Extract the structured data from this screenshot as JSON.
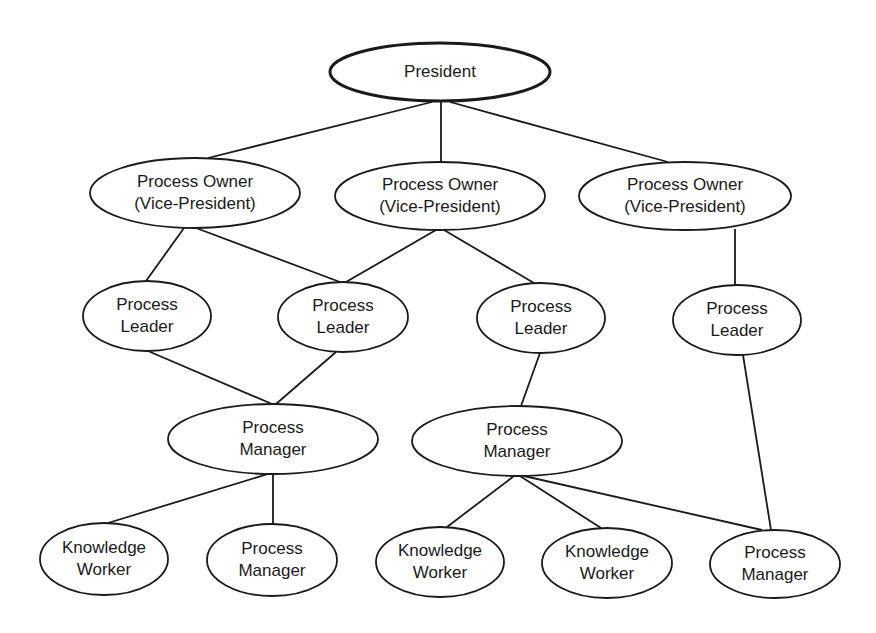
{
  "diagram": {
    "type": "org-chart",
    "colors": {
      "line": "#1a1a1a",
      "background": "#ffffff",
      "node_fill": "#ffffff"
    },
    "nodes": [
      {
        "id": "president",
        "lines": [
          "President"
        ],
        "cx": 440,
        "cy": 72,
        "rx": 110,
        "ry": 29,
        "root": true
      },
      {
        "id": "po1",
        "lines": [
          "Process Owner",
          "(Vice-President)"
        ],
        "cx": 195,
        "cy": 193,
        "rx": 105,
        "ry": 35
      },
      {
        "id": "po2",
        "lines": [
          "Process Owner",
          "(Vice-President)"
        ],
        "cx": 440,
        "cy": 196,
        "rx": 105,
        "ry": 34
      },
      {
        "id": "po3",
        "lines": [
          "Process Owner",
          "(Vice-President)"
        ],
        "cx": 685,
        "cy": 196,
        "rx": 106,
        "ry": 34
      },
      {
        "id": "pl1",
        "lines": [
          "Process",
          "Leader"
        ],
        "cx": 147,
        "cy": 316,
        "rx": 64,
        "ry": 35
      },
      {
        "id": "pl2",
        "lines": [
          "Process",
          "Leader"
        ],
        "cx": 343,
        "cy": 317,
        "rx": 65,
        "ry": 35
      },
      {
        "id": "pl3",
        "lines": [
          "Process",
          "Leader"
        ],
        "cx": 541,
        "cy": 318,
        "rx": 64,
        "ry": 35
      },
      {
        "id": "pl4",
        "lines": [
          "Process",
          "Leader"
        ],
        "cx": 737,
        "cy": 320,
        "rx": 64,
        "ry": 35
      },
      {
        "id": "pm1",
        "lines": [
          "Process",
          "Manager"
        ],
        "cx": 273,
        "cy": 439,
        "rx": 105,
        "ry": 35
      },
      {
        "id": "pm2",
        "lines": [
          "Process",
          "Manager"
        ],
        "cx": 517,
        "cy": 441,
        "rx": 105,
        "ry": 35
      },
      {
        "id": "kw1",
        "lines": [
          "Knowledge",
          "Worker"
        ],
        "cx": 104,
        "cy": 559,
        "rx": 64,
        "ry": 36
      },
      {
        "id": "pm3",
        "lines": [
          "Process",
          "Manager"
        ],
        "cx": 272,
        "cy": 560,
        "rx": 65,
        "ry": 36
      },
      {
        "id": "kw2",
        "lines": [
          "Knowledge",
          "Worker"
        ],
        "cx": 440,
        "cy": 562,
        "rx": 64,
        "ry": 35
      },
      {
        "id": "kw3",
        "lines": [
          "Knowledge",
          "Worker"
        ],
        "cx": 607,
        "cy": 563,
        "rx": 65,
        "ry": 35
      },
      {
        "id": "pm4",
        "lines": [
          "Process",
          "Manager"
        ],
        "cx": 775,
        "cy": 564,
        "rx": 65,
        "ry": 34
      }
    ],
    "edges": [
      {
        "from": "president",
        "to": "po1",
        "x1": 432,
        "y1": 102,
        "x2": 208,
        "y2": 158
      },
      {
        "from": "president",
        "to": "po2",
        "x1": 441,
        "y1": 102,
        "x2": 441,
        "y2": 162
      },
      {
        "from": "president",
        "to": "po3",
        "x1": 450,
        "y1": 102,
        "x2": 668,
        "y2": 162
      },
      {
        "from": "po1",
        "to": "pl1",
        "x1": 184,
        "y1": 228,
        "x2": 146,
        "y2": 281
      },
      {
        "from": "po1",
        "to": "pl2",
        "x1": 196,
        "y1": 228,
        "x2": 340,
        "y2": 282
      },
      {
        "from": "po2",
        "to": "pl2",
        "x1": 436,
        "y1": 230,
        "x2": 346,
        "y2": 282
      },
      {
        "from": "po2",
        "to": "pl3",
        "x1": 444,
        "y1": 230,
        "x2": 534,
        "y2": 283
      },
      {
        "from": "po3",
        "to": "pl4",
        "x1": 735,
        "y1": 229,
        "x2": 735,
        "y2": 285
      },
      {
        "from": "pl1",
        "to": "pm1",
        "x1": 148,
        "y1": 351,
        "x2": 272,
        "y2": 404
      },
      {
        "from": "pl2",
        "to": "pm1",
        "x1": 336,
        "y1": 352,
        "x2": 276,
        "y2": 404
      },
      {
        "from": "pl3",
        "to": "pm2",
        "x1": 540,
        "y1": 353,
        "x2": 521,
        "y2": 406
      },
      {
        "from": "pl4",
        "to": "pm4",
        "x1": 743,
        "y1": 355,
        "x2": 771,
        "y2": 530
      },
      {
        "from": "pm1",
        "to": "kw1",
        "x1": 268,
        "y1": 474,
        "x2": 108,
        "y2": 523
      },
      {
        "from": "pm1",
        "to": "pm3",
        "x1": 273,
        "y1": 474,
        "x2": 273,
        "y2": 525
      },
      {
        "from": "pm2",
        "to": "kw2",
        "x1": 514,
        "y1": 476,
        "x2": 447,
        "y2": 527
      },
      {
        "from": "pm2",
        "to": "kw3",
        "x1": 520,
        "y1": 476,
        "x2": 601,
        "y2": 528
      },
      {
        "from": "pm2",
        "to": "pm4",
        "x1": 524,
        "y1": 476,
        "x2": 762,
        "y2": 530
      }
    ]
  }
}
